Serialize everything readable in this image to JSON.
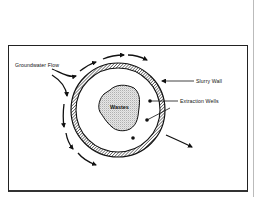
{
  "diagram": {
    "labels": {
      "groundwater_flow": "Groundwater Flow",
      "slurry_wall": "Slurry Wall",
      "extraction_wells": "Extraction Wells",
      "wastes": "Wastes"
    },
    "components": {
      "slurry_wall_ring": {
        "center": [
          118,
          110
        ],
        "outer_radius": 47,
        "inner_radius": 42,
        "fill": "hatched"
      },
      "waste_mass": {
        "fill": "stippled"
      },
      "extraction_wells_count": 3,
      "flow_arrows": "groundwater diverted around slurry wall"
    },
    "colors": {
      "line": "#111111",
      "background": "#ffffff",
      "waste_fill": "#cfcfcf"
    }
  }
}
